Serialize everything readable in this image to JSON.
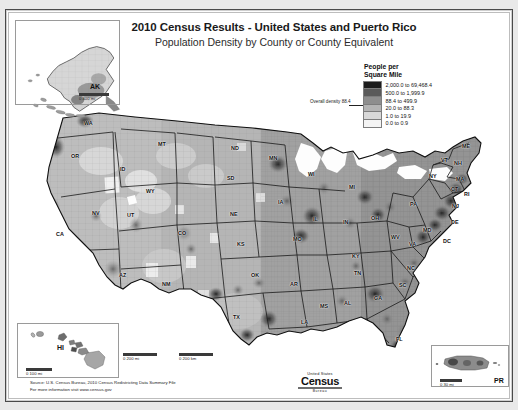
{
  "document": {
    "title": "2010 Census Results - United States and Puerto Rico",
    "subtitle": "Population Density by County or County Equivalent"
  },
  "legend": {
    "title_line1": "People per",
    "title_line2": "Square Mile",
    "overall_annotation": "Overall density 88.4",
    "classes": [
      {
        "label": "2,000.0 to 69,468.4",
        "color": "#1c1c1c",
        "min": 2000.0,
        "max": 69468.4
      },
      {
        "label": "500.0 to 1,999.9",
        "color": "#5a5a5a",
        "min": 500.0,
        "max": 1999.9
      },
      {
        "label": "88.4 to 499.9",
        "color": "#8e8e8e",
        "min": 88.4,
        "max": 499.9
      },
      {
        "label": "20.0 to 88.3",
        "color": "#b4b4b4",
        "min": 20.0,
        "max": 88.3
      },
      {
        "label": "1.0 to 19.9",
        "color": "#d8d8d8",
        "min": 1.0,
        "max": 19.9
      },
      {
        "label": "0.0 to 0.9",
        "color": "#f4f4f4",
        "min": 0.0,
        "max": 0.9
      }
    ]
  },
  "insets": {
    "alaska": {
      "label": "AK",
      "scale_text": "0         400 mi"
    },
    "hawaii": {
      "label": "HI",
      "scale_text": "0     100 mi"
    },
    "puerto_rico": {
      "label": "PR",
      "scale_text": "0    30 mi"
    }
  },
  "main_map": {
    "scale_left_text": "0          200 mi",
    "scale_right_text": "0        200 km",
    "state_labels": [
      {
        "abbr": "WA",
        "x": 88,
        "y": 122
      },
      {
        "abbr": "OR",
        "x": 75,
        "y": 155
      },
      {
        "abbr": "ID",
        "x": 124,
        "y": 168
      },
      {
        "abbr": "MT",
        "x": 162,
        "y": 143
      },
      {
        "abbr": "WY",
        "x": 150,
        "y": 190
      },
      {
        "abbr": "NV",
        "x": 96,
        "y": 212
      },
      {
        "abbr": "UT",
        "x": 131,
        "y": 214
      },
      {
        "abbr": "CA",
        "x": 60,
        "y": 233
      },
      {
        "abbr": "AZ",
        "x": 123,
        "y": 274
      },
      {
        "abbr": "NM",
        "x": 166,
        "y": 283
      },
      {
        "abbr": "CO",
        "x": 182,
        "y": 232
      },
      {
        "abbr": "ND",
        "x": 235,
        "y": 147
      },
      {
        "abbr": "SD",
        "x": 231,
        "y": 177
      },
      {
        "abbr": "NE",
        "x": 234,
        "y": 213
      },
      {
        "abbr": "KS",
        "x": 241,
        "y": 243
      },
      {
        "abbr": "OK",
        "x": 255,
        "y": 274
      },
      {
        "abbr": "TX",
        "x": 237,
        "y": 316
      },
      {
        "abbr": "MN",
        "x": 273,
        "y": 157
      },
      {
        "abbr": "IA",
        "x": 282,
        "y": 201
      },
      {
        "abbr": "MO",
        "x": 297,
        "y": 238
      },
      {
        "abbr": "AR",
        "x": 294,
        "y": 283
      },
      {
        "abbr": "LA",
        "x": 305,
        "y": 321
      },
      {
        "abbr": "WI",
        "x": 312,
        "y": 173
      },
      {
        "abbr": "IL",
        "x": 317,
        "y": 218
      },
      {
        "abbr": "MS",
        "x": 324,
        "y": 305
      },
      {
        "abbr": "MI",
        "x": 353,
        "y": 186
      },
      {
        "abbr": "IN",
        "x": 347,
        "y": 221
      },
      {
        "abbr": "OH",
        "x": 375,
        "y": 217
      },
      {
        "abbr": "KY",
        "x": 356,
        "y": 255
      },
      {
        "abbr": "TN",
        "x": 358,
        "y": 272
      },
      {
        "abbr": "AL",
        "x": 348,
        "y": 302
      },
      {
        "abbr": "GA",
        "x": 378,
        "y": 297
      },
      {
        "abbr": "FL",
        "x": 400,
        "y": 338
      },
      {
        "abbr": "SC",
        "x": 403,
        "y": 284
      },
      {
        "abbr": "NC",
        "x": 411,
        "y": 267
      },
      {
        "abbr": "VA",
        "x": 413,
        "y": 243
      },
      {
        "abbr": "WV",
        "x": 395,
        "y": 236
      },
      {
        "abbr": "MD",
        "x": 427,
        "y": 229
      },
      {
        "abbr": "DE",
        "x": 455,
        "y": 221
      },
      {
        "abbr": "DC",
        "x": 447,
        "y": 240
      },
      {
        "abbr": "PA",
        "x": 414,
        "y": 203
      },
      {
        "abbr": "NY",
        "x": 433,
        "y": 175
      },
      {
        "abbr": "NJ",
        "x": 456,
        "y": 205
      },
      {
        "abbr": "CT",
        "x": 455,
        "y": 188
      },
      {
        "abbr": "RI",
        "x": 468,
        "y": 193
      },
      {
        "abbr": "MA",
        "x": 460,
        "y": 178
      },
      {
        "abbr": "VT",
        "x": 445,
        "y": 159
      },
      {
        "abbr": "NH",
        "x": 458,
        "y": 162
      },
      {
        "abbr": "ME",
        "x": 466,
        "y": 145
      }
    ]
  },
  "footer": {
    "source_line1": "Source:  U.S. Census Bureau, 2010 Census Redistricting Data Summary File",
    "source_line2": "For more information visit www.census.gov",
    "logo_top": "United States",
    "logo_main": "Census",
    "logo_sub": "Bureau"
  }
}
